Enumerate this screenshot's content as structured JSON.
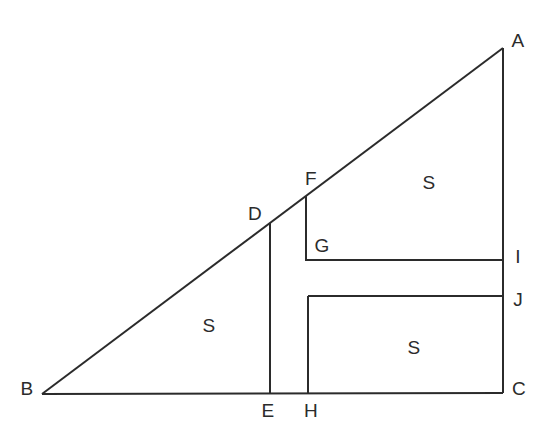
{
  "figure": {
    "canvas": {
      "width": 550,
      "height": 435
    },
    "colors": {
      "background": "#ffffff",
      "stroke": "#2b2b2b",
      "label": "#2b2b2b"
    },
    "stroke_width": 2
  },
  "vertices": [
    {
      "id": "A",
      "label": "A",
      "x": 503,
      "y": 48,
      "label_x": 518,
      "label_y": 40
    },
    {
      "id": "B",
      "label": "B",
      "x": 42,
      "y": 394,
      "label_x": 27,
      "label_y": 388
    },
    {
      "id": "C",
      "label": "C",
      "x": 503,
      "y": 393,
      "label_x": 519,
      "label_y": 388
    },
    {
      "id": "D",
      "label": "D",
      "x": 270,
      "y": 223,
      "label_x": 255,
      "label_y": 213
    },
    {
      "id": "E",
      "label": "E",
      "x": 270,
      "y": 393,
      "label_x": 268,
      "label_y": 410
    },
    {
      "id": "F",
      "label": "F",
      "x": 306,
      "y": 196,
      "label_x": 311,
      "label_y": 178
    },
    {
      "id": "G",
      "label": "G",
      "x": 306,
      "y": 260,
      "label_x": 322,
      "label_y": 245
    },
    {
      "id": "H",
      "label": "H",
      "x": 308,
      "y": 393,
      "label_x": 311,
      "label_y": 410
    },
    {
      "id": "I",
      "label": "I",
      "x": 503,
      "y": 260,
      "label_x": 518,
      "label_y": 256
    },
    {
      "id": "J",
      "label": "J",
      "x": 503,
      "y": 297,
      "label_x": 518,
      "label_y": 299
    }
  ],
  "segments": [
    {
      "id": "hypotenuse-BA",
      "name": "hypotenuse-b-to-a",
      "x1": 42,
      "y1": 394,
      "x2": 503,
      "y2": 48
    },
    {
      "id": "base-BC",
      "name": "base-b-to-c",
      "x1": 42,
      "y1": 394,
      "x2": 503,
      "y2": 393
    },
    {
      "id": "right-AC",
      "name": "right-side-a-to-c",
      "x1": 503,
      "y1": 48,
      "x2": 503,
      "y2": 393
    },
    {
      "id": "vert-DE",
      "name": "vertical-d-to-e",
      "x1": 270,
      "y1": 223,
      "x2": 270,
      "y2": 393
    },
    {
      "id": "vert-FG",
      "name": "vertical-f-to-g",
      "x1": 306,
      "y1": 196,
      "x2": 306,
      "y2": 261
    },
    {
      "id": "horiz-GI",
      "name": "horizontal-g-to-i",
      "x1": 306,
      "y1": 260,
      "x2": 503,
      "y2": 260
    },
    {
      "id": "horiz-JH",
      "name": "horizontal-j-to-h",
      "x1": 308,
      "y1": 296,
      "x2": 503,
      "y2": 296
    },
    {
      "id": "vert-HJ",
      "name": "vertical-h-to-j",
      "x1": 308,
      "y1": 296,
      "x2": 308,
      "y2": 393
    }
  ],
  "regions": [
    {
      "id": "square-left",
      "label": "S",
      "label_x": 209,
      "label_y": 325
    },
    {
      "id": "square-upper-right",
      "label": "S",
      "label_x": 429,
      "label_y": 182
    },
    {
      "id": "square-lower-right",
      "label": "S",
      "label_x": 414,
      "label_y": 347
    }
  ]
}
